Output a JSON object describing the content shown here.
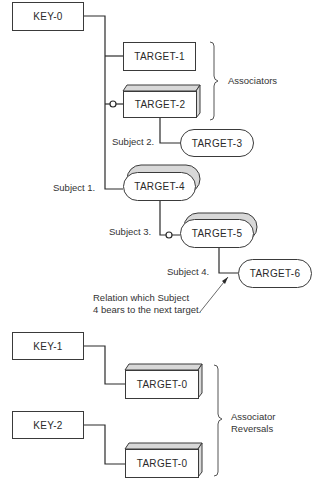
{
  "diagram": {
    "keys": [
      {
        "id": "key0",
        "label": "KEY-0"
      },
      {
        "id": "key1",
        "label": "KEY-1"
      },
      {
        "id": "key2",
        "label": "KEY-2"
      }
    ],
    "targets": [
      {
        "id": "t1",
        "label": "TARGET-1",
        "shape": "rectangle"
      },
      {
        "id": "t2",
        "label": "TARGET-2",
        "shape": "3d-box"
      },
      {
        "id": "t3",
        "label": "TARGET-3",
        "shape": "pill"
      },
      {
        "id": "t4",
        "label": "TARGET-4",
        "shape": "stacked-pill"
      },
      {
        "id": "t5",
        "label": "TARGET-5",
        "shape": "stacked-pill"
      },
      {
        "id": "t6",
        "label": "TARGET-6",
        "shape": "pill"
      },
      {
        "id": "t0a",
        "label": "TARGET-0",
        "shape": "3d-box"
      },
      {
        "id": "t0b",
        "label": "TARGET-0",
        "shape": "3d-box"
      }
    ],
    "subjects": [
      "Subject 1.",
      "Subject 2.",
      "Subject 3.",
      "Subject 4."
    ],
    "braces": {
      "associators": "Associators",
      "reversals_line1": "Associator",
      "reversals_line2": "Reversals"
    },
    "annotation": {
      "line1": "Relation which Subject",
      "line2": "4 bears to the next target."
    }
  }
}
